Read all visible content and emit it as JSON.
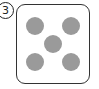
{
  "label": {
    "number": "3",
    "glyph": "③"
  },
  "die": {
    "face_value": 5,
    "dot_color": "#9a9a9a",
    "border_color": "#333333",
    "dots": [
      {
        "x": 9,
        "y": 12
      },
      {
        "x": 45,
        "y": 12
      },
      {
        "x": 27,
        "y": 30
      },
      {
        "x": 9,
        "y": 48
      },
      {
        "x": 45,
        "y": 48
      }
    ]
  }
}
